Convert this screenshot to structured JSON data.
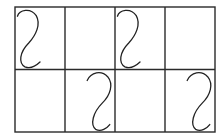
{
  "diagram": {
    "title": "",
    "grid": {
      "rows": 2,
      "columns": 4,
      "line_color": "#2a2a2a",
      "background": "#ffffff"
    },
    "curve_types": {
      "s-top-left": "S-shaped curve hugging left side, opening from top-left, ending at bottom with a rightward hook",
      "s-top-right": "S-shaped curve shifted right, starting mid-top with a hook, descending to bottom-center with a rightward hook"
    },
    "cells": [
      {
        "row": 0,
        "col": 0,
        "curve": "s-top-left"
      },
      {
        "row": 0,
        "col": 1,
        "curve": null
      },
      {
        "row": 0,
        "col": 2,
        "curve": "s-top-left"
      },
      {
        "row": 0,
        "col": 3,
        "curve": null
      },
      {
        "row": 1,
        "col": 0,
        "curve": null
      },
      {
        "row": 1,
        "col": 1,
        "curve": "s-top-right"
      },
      {
        "row": 1,
        "col": 2,
        "curve": null
      },
      {
        "row": 1,
        "col": 3,
        "curve": "s-top-right"
      }
    ],
    "curve_color": "#222222"
  }
}
